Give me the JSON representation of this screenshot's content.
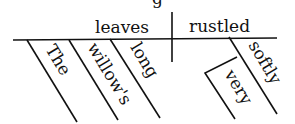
{
  "diagram": {
    "type": "sentence-diagram",
    "subject": "leaves",
    "predicate": "rustled",
    "subject_modifiers": [
      "The",
      "willow's",
      "long"
    ],
    "predicate_modifiers": [
      "softly"
    ],
    "modifier_of_modifier": {
      "word": "very",
      "modifies": "softly"
    },
    "partial_glyph_top": "g",
    "colors": {
      "ink": "#111111",
      "background": "#ffffff"
    }
  }
}
